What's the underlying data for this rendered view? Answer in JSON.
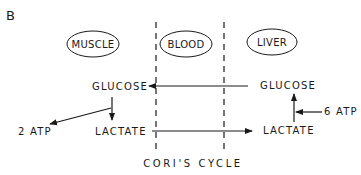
{
  "panel_label": "B",
  "compartments": {
    "muscle": "MUSCLE",
    "blood": "BLOOD",
    "liver": "LIVER"
  },
  "muscle": {
    "glucose": "GLUCOSE",
    "lactate": "LACTATE",
    "atp": "2 ATP"
  },
  "liver": {
    "glucose": "GLUCOSE",
    "lactate": "LACTATE",
    "atp": "6 ATP"
  },
  "caption": "CORI'S CYCLE",
  "colors": {
    "ink": "#1a1a1a",
    "background": "#ffffff"
  }
}
